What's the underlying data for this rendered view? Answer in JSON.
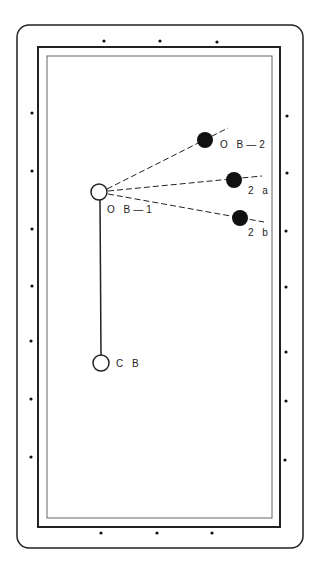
{
  "diagram": {
    "type": "billiard-table-shot-diagram",
    "balls": {
      "cue_ball": {
        "label": "C B",
        "x": 101,
        "y": 363
      },
      "object_ball_1": {
        "label": "O B—1",
        "x": 99,
        "y": 192
      },
      "object_ball_2": {
        "label": "O B—2",
        "x": 205,
        "y": 167
      },
      "ball_2a": {
        "label": "2 a",
        "x": 234,
        "y": 180
      },
      "ball_2b": {
        "label": "2 b",
        "x": 240,
        "y": 218
      }
    },
    "colors": {
      "line": "#222222",
      "ball_fill_dark": "#111111",
      "ball_fill_light": "#ffffff"
    }
  }
}
